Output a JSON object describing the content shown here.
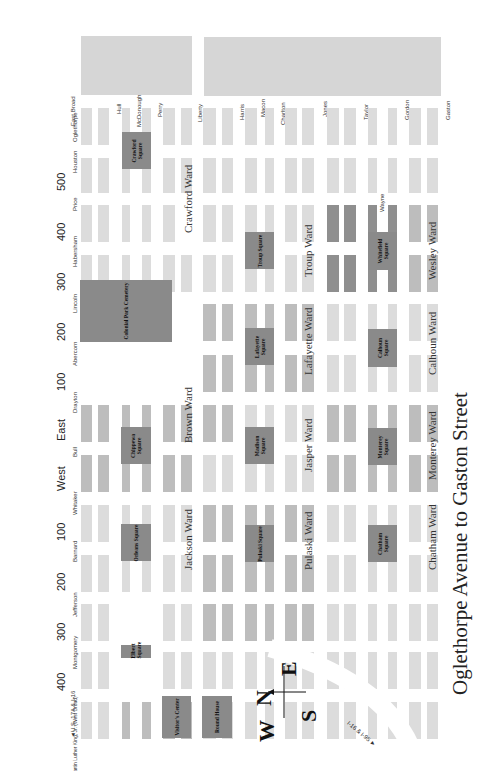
{
  "title": "Oglethorpe Avenue to Gaston Street",
  "cross_streets_left": [
    {
      "name": "East Broad",
      "y": 104
    },
    {
      "name": "Oglethorpe",
      "y": 120
    },
    {
      "name": "Houston",
      "y": 158
    },
    {
      "name": "Price",
      "y": 200
    },
    {
      "name": "Habersham",
      "y": 247
    },
    {
      "name": "Lincoln",
      "y": 298
    },
    {
      "name": "Abercorn",
      "y": 348
    },
    {
      "name": "Drayton",
      "y": 398
    },
    {
      "name": "Bull",
      "y": 448
    },
    {
      "name": "Whitaker",
      "y": 497
    },
    {
      "name": "Barnard",
      "y": 547
    },
    {
      "name": "Jefferson",
      "y": 597
    },
    {
      "name": "Montgomery",
      "y": 647
    },
    {
      "name": "Martin Luther King, Jr. (West Broad)",
      "y": 697
    }
  ],
  "block_numbers": [
    {
      "label": "500",
      "y": 180
    },
    {
      "label": "400",
      "y": 230
    },
    {
      "label": "300",
      "y": 280
    },
    {
      "label": "200",
      "y": 330
    },
    {
      "label": "100",
      "y": 380
    },
    {
      "label": "East",
      "y": 430
    },
    {
      "label": "West",
      "y": 480
    },
    {
      "label": "100",
      "y": 530
    },
    {
      "label": "200",
      "y": 580
    },
    {
      "label": "300",
      "y": 630
    },
    {
      "label": "400",
      "y": 680
    }
  ],
  "highway_labels": {
    "us17a": "U.S. 17A & I-16",
    "i16": "I-16 & I-95"
  },
  "horizontal_streets_top": [
    {
      "name": "Hull",
      "x": 116
    },
    {
      "name": "McDonough",
      "x": 136
    },
    {
      "name": "Perry",
      "x": 157
    },
    {
      "name": "Liberty",
      "x": 197
    },
    {
      "name": "Harris",
      "x": 239
    },
    {
      "name": "Macon",
      "x": 260
    },
    {
      "name": "Charlton",
      "x": 280
    },
    {
      "name": "Jones",
      "x": 322
    },
    {
      "name": "Taylor",
      "x": 363
    },
    {
      "name": "Gordon",
      "x": 404
    },
    {
      "name": "Gaston",
      "x": 445
    }
  ],
  "wayne_label": "Wayne",
  "squares": [
    {
      "name": "Crawford Square",
      "x": 122,
      "y": 132,
      "w": 29,
      "h": 37
    },
    {
      "name": "Colonial Park Cemetery",
      "x": 80,
      "y": 280,
      "w": 92,
      "h": 62
    },
    {
      "name": "Troup Square",
      "x": 245,
      "y": 232,
      "w": 29,
      "h": 37
    },
    {
      "name": "Whitefield Square",
      "x": 368,
      "y": 232,
      "w": 29,
      "h": 38
    },
    {
      "name": "Lafayette Square",
      "x": 245,
      "y": 328,
      "w": 29,
      "h": 37
    },
    {
      "name": "Calhoun Square",
      "x": 368,
      "y": 329,
      "w": 29,
      "h": 38
    },
    {
      "name": "Chippewa Square",
      "x": 121,
      "y": 427,
      "w": 30,
      "h": 37
    },
    {
      "name": "Madison Square",
      "x": 245,
      "y": 427,
      "w": 29,
      "h": 37
    },
    {
      "name": "Monterey Square",
      "x": 368,
      "y": 428,
      "w": 29,
      "h": 37
    },
    {
      "name": "Orleans Square",
      "x": 121,
      "y": 524,
      "w": 30,
      "h": 37
    },
    {
      "name": "Pulaski Square",
      "x": 245,
      "y": 525,
      "w": 29,
      "h": 37
    },
    {
      "name": "Chatham Square",
      "x": 368,
      "y": 525,
      "w": 29,
      "h": 37
    },
    {
      "name": "Elbert Square",
      "x": 121,
      "y": 645,
      "w": 30,
      "h": 13
    },
    {
      "name": "Visitor's Center",
      "x": 162,
      "y": 696,
      "w": 29,
      "h": 42
    },
    {
      "name": "Round House",
      "x": 202,
      "y": 696,
      "w": 30,
      "h": 42
    }
  ],
  "wards": [
    {
      "name": "Crawford Ward",
      "x": 182,
      "y": 233
    },
    {
      "name": "Troup Ward",
      "x": 302,
      "y": 277
    },
    {
      "name": "Wesley Ward",
      "x": 426,
      "y": 280
    },
    {
      "name": "Lafayette Ward",
      "x": 302,
      "y": 375
    },
    {
      "name": "Calhoun Ward",
      "x": 426,
      "y": 375
    },
    {
      "name": "Brown Ward",
      "x": 182,
      "y": 443
    },
    {
      "name": "Jasper Ward",
      "x": 302,
      "y": 472
    },
    {
      "name": "Monterey Ward",
      "x": 426,
      "y": 480
    },
    {
      "name": "Pulaski Ward",
      "x": 302,
      "y": 570
    },
    {
      "name": "Chatham Ward",
      "x": 426,
      "y": 570
    },
    {
      "name": "Jackson Ward",
      "x": 182,
      "y": 570
    }
  ],
  "compass": {
    "n": "N",
    "e": "E",
    "s": "S",
    "w": "W"
  },
  "colors": {
    "light": "#dcdcdc",
    "medium": "#bdbdbd",
    "dark": "#8f8f8f",
    "square": "#8a8a8a"
  }
}
